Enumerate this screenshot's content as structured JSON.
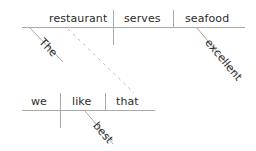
{
  "diagram": {
    "type": "reed-kellogg-sentence-diagram",
    "line_color": "#a9a9a9",
    "text_color": "#2b2b2b",
    "clauses": [
      {
        "name": "main-clause",
        "words": [
          {
            "id": "the",
            "text": "The",
            "role": "article-modifier",
            "orientation": "slanted"
          },
          {
            "id": "restaurant",
            "text": "restaurant",
            "role": "subject",
            "orientation": "horizontal"
          },
          {
            "id": "serves",
            "text": "serves",
            "role": "verb",
            "orientation": "horizontal"
          },
          {
            "id": "seafood",
            "text": "seafood",
            "role": "direct-object",
            "orientation": "horizontal"
          },
          {
            "id": "excellent",
            "text": "excellent",
            "role": "adjective-modifier",
            "orientation": "slanted"
          }
        ]
      },
      {
        "name": "subordinate-clause",
        "words": [
          {
            "id": "we",
            "text": "we",
            "role": "subject",
            "orientation": "horizontal"
          },
          {
            "id": "like",
            "text": "like",
            "role": "verb",
            "orientation": "horizontal"
          },
          {
            "id": "that",
            "text": "that",
            "role": "direct-object",
            "orientation": "horizontal"
          },
          {
            "id": "best",
            "text": "best",
            "role": "adverb-modifier",
            "orientation": "slanted"
          }
        ]
      }
    ],
    "connector": {
      "id": "dashed-connector",
      "style": "dashed",
      "meaning": "relative-clause-link"
    }
  }
}
